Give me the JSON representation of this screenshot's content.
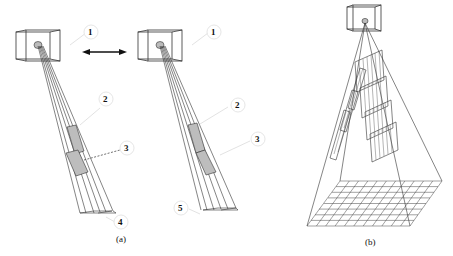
{
  "figure": {
    "panel_a": {
      "caption": "(a)",
      "left_view": {
        "labels": [
          "1",
          "2",
          "3",
          "4"
        ]
      },
      "right_view": {
        "labels": [
          "1",
          "2",
          "3",
          "5"
        ]
      },
      "arrow": "double-headed-arrow"
    },
    "panel_b": {
      "caption": "(b)",
      "grid": {
        "rows": 8,
        "cols": 11
      }
    }
  }
}
